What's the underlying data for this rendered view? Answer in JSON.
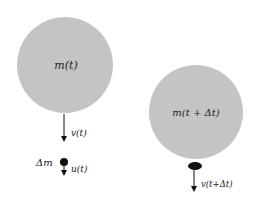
{
  "diagram": {
    "colors": {
      "body": "#c4c4c4",
      "ink": "#111111"
    },
    "left": {
      "mass_label": "m(t)",
      "velocity_label": "v(t)",
      "ejected_mass_label": "Δm",
      "ejected_velocity_label": "u(t)"
    },
    "right": {
      "mass_label": "m(t + Δt)",
      "velocity_label": "v(t+Δt)"
    }
  }
}
